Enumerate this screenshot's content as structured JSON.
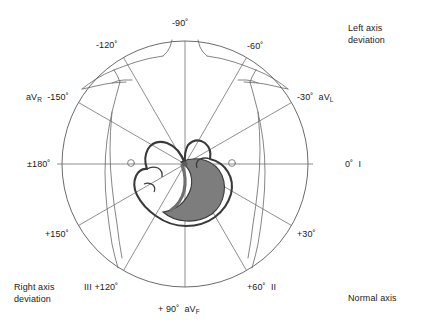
{
  "figure": {
    "title_present": false,
    "diagram_type": "hexaxial-reference-system-with-torso-and-heart",
    "center": {
      "x": 185,
      "y": 164
    },
    "radius": 123,
    "colors": {
      "background": "#ffffff",
      "line": "#4a4a4a",
      "circle": "#5a5a5a",
      "body_outline": "#6b6b6b",
      "heart_outline": "#3a3a3a",
      "heart_shading": "#7a7a7a",
      "text": "#1a1a1a"
    }
  },
  "axis_labels": [
    {
      "id": "minus-90",
      "degrees": "-90˚",
      "lead": "",
      "lead_sub": "",
      "angle": -90,
      "x": 172,
      "y": 18,
      "align": "left"
    },
    {
      "id": "minus-120",
      "degrees": "-120˚",
      "lead": "",
      "lead_sub": "",
      "angle": -120,
      "x": 96,
      "y": 40,
      "align": "left"
    },
    {
      "id": "minus-60",
      "degrees": "-60˚",
      "lead": "",
      "lead_sub": "",
      "angle": -60,
      "x": 247,
      "y": 41,
      "align": "left"
    },
    {
      "id": "minus-150",
      "degrees": "-150˚",
      "lead": "aV",
      "lead_sub": "R",
      "angle": -150,
      "x": 26,
      "y": 92,
      "align": "left"
    },
    {
      "id": "minus-30",
      "degrees": "-30˚",
      "lead": "aV",
      "lead_sub": "L",
      "angle": -30,
      "x": 297,
      "y": 92,
      "align": "left"
    },
    {
      "id": "plus-180",
      "degrees": "±180˚",
      "lead": "",
      "lead_sub": "",
      "angle": 180,
      "x": 27,
      "y": 159,
      "align": "left"
    },
    {
      "id": "zero",
      "degrees": "0˚",
      "lead": "I",
      "lead_sub": "",
      "angle": 0,
      "x": 345,
      "y": 159,
      "align": "left"
    },
    {
      "id": "plus-150",
      "degrees": "+150˚",
      "lead": "",
      "lead_sub": "",
      "angle": 150,
      "x": 45,
      "y": 229,
      "align": "left"
    },
    {
      "id": "plus-30",
      "degrees": "+30˚",
      "lead": "",
      "lead_sub": "",
      "angle": 30,
      "x": 297,
      "y": 229,
      "align": "left"
    },
    {
      "id": "plus-120",
      "degrees": "+120˚",
      "lead": "III",
      "lead_sub": "",
      "angle": 120,
      "x": 84,
      "y": 282,
      "align": "left"
    },
    {
      "id": "plus-60",
      "degrees": "+60˚",
      "lead": "II",
      "lead_sub": "",
      "angle": 60,
      "x": 247,
      "y": 282,
      "align": "left"
    },
    {
      "id": "plus-90",
      "degrees": "+ 90˚",
      "lead": "aV",
      "lead_sub": "F",
      "angle": 90,
      "x": 158,
      "y": 304,
      "align": "left"
    }
  ],
  "quadrant_labels": [
    {
      "id": "left-axis-deviation",
      "line1": "Left axis",
      "line2": "deviation",
      "x": 348,
      "y": 22
    },
    {
      "id": "right-axis-deviation",
      "line1": "Right axis",
      "line2": "deviation",
      "x": 14,
      "y": 281
    },
    {
      "id": "normal-axis",
      "line1": "Normal axis",
      "line2": "",
      "x": 348,
      "y": 292
    }
  ]
}
